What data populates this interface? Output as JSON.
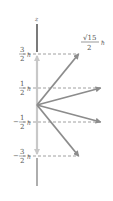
{
  "diagram": {
    "axis_label": "z",
    "magnitude_label": {
      "numerator": "√15",
      "denominator": "2",
      "unit": "ħ"
    },
    "levels": [
      {
        "sign": "",
        "numerator": "3",
        "denominator": "2",
        "unit": "ħ",
        "m": 1.5
      },
      {
        "sign": "",
        "numerator": "1",
        "denominator": "2",
        "unit": "ħ",
        "m": 0.5
      },
      {
        "sign": "−",
        "numerator": "1",
        "denominator": "2",
        "unit": "ħ",
        "m": -0.5
      },
      {
        "sign": "−",
        "numerator": "3",
        "denominator": "2",
        "unit": "ħ",
        "m": -1.5
      }
    ],
    "magnitude": 1.936,
    "colors": {
      "axis": "#222222",
      "axis_lower": "#777777",
      "vector": "#8c8c8c",
      "z_component": "#c8c8c8",
      "dash": "#888888"
    }
  }
}
